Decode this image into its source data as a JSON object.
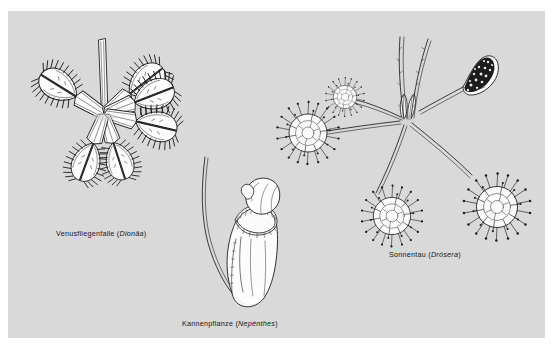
{
  "figure": {
    "background_color": "#ffffff",
    "plate_color": "#d9d9d9",
    "ink_color": "#1a1a1a",
    "fill_color": "#fdfdfd",
    "width": 554,
    "height": 347
  },
  "specimens": [
    {
      "id": "venus-flytrap",
      "common_name": "Venusfliegenfalle",
      "scientific_name": "Dionäa",
      "caption_prefix": "Venusfliegenfalle (",
      "caption_suffix": ")",
      "trap_count": 6,
      "position": "left"
    },
    {
      "id": "pitcher-plant",
      "common_name": "Kannenpflanze",
      "scientific_name": "Nepénthes",
      "caption_prefix": "Kannenpflanze (",
      "caption_suffix": ")",
      "trap_count": 1,
      "position": "center-bottom"
    },
    {
      "id": "sundew",
      "common_name": "Sonnentau",
      "scientific_name": "Drósera",
      "caption_prefix": "Sonnentau (",
      "caption_suffix": ")",
      "trap_count": 4,
      "position": "right"
    }
  ]
}
